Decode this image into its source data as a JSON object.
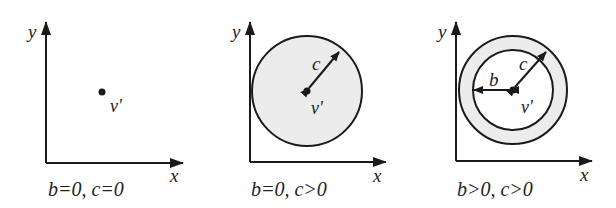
{
  "figure": {
    "panels": [
      {
        "id": "panel-1",
        "caption": "b=0, c=0",
        "x_axis_label": "x",
        "y_axis_label": "y",
        "point_label": "v'",
        "outer_radius_label": null,
        "inner_radius_label": null
      },
      {
        "id": "panel-2",
        "caption": "b=0, c>0",
        "x_axis_label": "x",
        "y_axis_label": "y",
        "point_label": "v'",
        "outer_radius_label": "c",
        "inner_radius_label": null
      },
      {
        "id": "panel-3",
        "caption": "b>0, c>0",
        "x_axis_label": "x",
        "y_axis_label": "y",
        "point_label": "v'",
        "outer_radius_label": "c",
        "inner_radius_label": "b"
      }
    ],
    "colors": {
      "stroke": "#1a1a1a",
      "fill_region": "#ececec",
      "background": "#ffffff"
    }
  }
}
